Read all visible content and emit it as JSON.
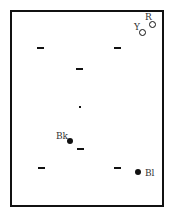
{
  "diagram": {
    "frame": {
      "x": 10,
      "y": 10,
      "width": 153,
      "height": 196,
      "border_color": "#111111"
    },
    "dashes": [
      {
        "x": 37,
        "y": 47
      },
      {
        "x": 114,
        "y": 47
      },
      {
        "x": 76,
        "y": 68
      },
      {
        "x": 77,
        "y": 148
      },
      {
        "x": 38,
        "y": 167
      },
      {
        "x": 114,
        "y": 167
      }
    ],
    "center_dot": {
      "x": 79,
      "y": 106
    },
    "markers": [
      {
        "id": "R",
        "label": "R",
        "style": "ring",
        "x": 152,
        "y": 24
      },
      {
        "id": "Y",
        "label": "Y",
        "style": "ring",
        "x": 142,
        "y": 32
      },
      {
        "id": "Bk",
        "label": "Bk",
        "style": "filled",
        "x": 70,
        "y": 141
      },
      {
        "id": "Bl",
        "label": "Bl",
        "style": "filled",
        "x": 138,
        "y": 172
      }
    ]
  }
}
